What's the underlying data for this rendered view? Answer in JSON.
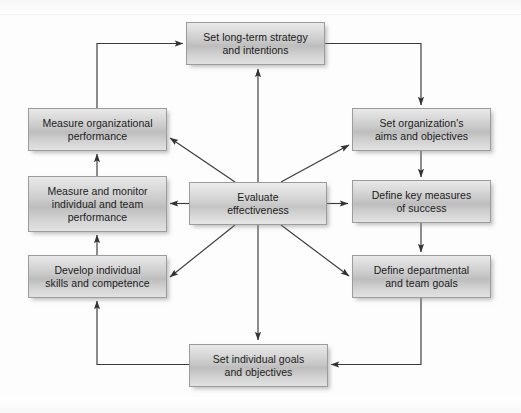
{
  "diagram": {
    "type": "cycle-flowchart",
    "palette": {
      "box_fill_light": "#e9e9e9",
      "box_fill_mid": "#bdbdbd",
      "box_border": "#9c9c9c",
      "connector": "#3a3a3a",
      "text": "#1b1b1b",
      "background": "#fdfdfd"
    },
    "nodes": [
      {
        "id": "set-long-term-strategy",
        "label": "Set long-term strategy\nand intentions",
        "x": 186,
        "y": 22,
        "w": 139,
        "h": 43
      },
      {
        "id": "set-organizations-aims",
        "label": "Set organization's\naims and objectives",
        "x": 352,
        "y": 108,
        "w": 139,
        "h": 43
      },
      {
        "id": "define-key-measures",
        "label": "Define key measures\nof success",
        "x": 352,
        "y": 180,
        "w": 139,
        "h": 43
      },
      {
        "id": "define-departmental-goals",
        "label": "Define departmental\nand team goals",
        "x": 352,
        "y": 255,
        "w": 139,
        "h": 43
      },
      {
        "id": "set-individual-goals",
        "label": "Set individual goals\nand objectives",
        "x": 189,
        "y": 344,
        "w": 139,
        "h": 43
      },
      {
        "id": "develop-individual-skills",
        "label": "Develop individual\nskills and competence",
        "x": 28,
        "y": 255,
        "w": 139,
        "h": 43
      },
      {
        "id": "measure-monitor-individual",
        "label": "Measure and monitor\nindividual and team\nperformance",
        "x": 28,
        "y": 176,
        "w": 139,
        "h": 56
      },
      {
        "id": "measure-organizational",
        "label": "Measure organizational\nperformance",
        "x": 28,
        "y": 108,
        "w": 139,
        "h": 43
      },
      {
        "id": "evaluate-effectiveness",
        "label": "Evaluate\neffectiveness",
        "x": 189,
        "y": 182,
        "w": 138,
        "h": 43,
        "center": true
      }
    ],
    "connections": [
      {
        "from": "set-long-term-strategy",
        "to": "set-organizations-aims",
        "kind": "outer-loop"
      },
      {
        "from": "set-organizations-aims",
        "to": "define-key-measures",
        "kind": "outer-loop"
      },
      {
        "from": "define-key-measures",
        "to": "define-departmental-goals",
        "kind": "outer-loop"
      },
      {
        "from": "define-departmental-goals",
        "to": "set-individual-goals",
        "kind": "outer-loop"
      },
      {
        "from": "set-individual-goals",
        "to": "develop-individual-skills",
        "kind": "outer-loop"
      },
      {
        "from": "develop-individual-skills",
        "to": "measure-monitor-individual",
        "kind": "outer-loop"
      },
      {
        "from": "measure-monitor-individual",
        "to": "measure-organizational",
        "kind": "outer-loop"
      },
      {
        "from": "measure-organizational",
        "to": "set-long-term-strategy",
        "kind": "outer-loop"
      },
      {
        "from": "evaluate-effectiveness",
        "to": "set-long-term-strategy",
        "kind": "spoke"
      },
      {
        "from": "evaluate-effectiveness",
        "to": "set-organizations-aims",
        "kind": "spoke"
      },
      {
        "from": "evaluate-effectiveness",
        "to": "define-key-measures",
        "kind": "spoke"
      },
      {
        "from": "evaluate-effectiveness",
        "to": "define-departmental-goals",
        "kind": "spoke"
      },
      {
        "from": "evaluate-effectiveness",
        "to": "set-individual-goals",
        "kind": "spoke"
      },
      {
        "from": "evaluate-effectiveness",
        "to": "develop-individual-skills",
        "kind": "spoke"
      },
      {
        "from": "evaluate-effectiveness",
        "to": "measure-monitor-individual",
        "kind": "spoke"
      },
      {
        "from": "evaluate-effectiveness",
        "to": "measure-organizational",
        "kind": "spoke"
      }
    ]
  }
}
